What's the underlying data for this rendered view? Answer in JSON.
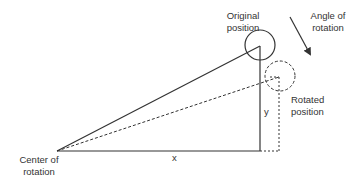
{
  "diagram": {
    "labels": {
      "original_position": [
        "Original",
        "position"
      ],
      "angle_of_rotation": [
        "Angle of",
        "rotation"
      ],
      "rotated_position": [
        "Rotated",
        "position"
      ],
      "center_of_rotation": [
        "Center of",
        "rotation"
      ],
      "x": "x",
      "y": "y"
    },
    "colors": {
      "line": "#333333",
      "text": "#333333",
      "background": "#ffffff"
    }
  }
}
